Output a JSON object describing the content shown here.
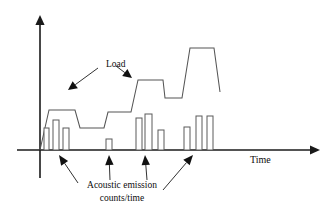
{
  "figure": {
    "background_color": "#ffffff",
    "axis_color": "#1a1a1a",
    "curve_color": "#555555",
    "bar_stroke_color": "#5a5a5a",
    "bar_fill_color": "#ffffff"
  },
  "labels": {
    "x_axis": "Time",
    "load": "Load",
    "caption_line1": "Acoustic emission",
    "caption_line2": "counts/time"
  },
  "icons": {
    "y_axis_arrow": "arrow-up-icon",
    "x_axis_arrow": "arrow-right-icon",
    "load_pointer_1": "arrow-pointer-icon",
    "load_pointer_2": "arrow-pointer-icon",
    "ae_pointer_1": "arrow-up-pointer-icon",
    "ae_pointer_2": "arrow-up-pointer-icon",
    "ae_pointer_3": "arrow-up-pointer-icon",
    "ae_pointer_4": "arrow-up-pointer-icon"
  },
  "chart_data": {
    "type": "bar",
    "title": "",
    "xlabel": "Time",
    "ylabel": "",
    "grid": false,
    "legend": "none",
    "axis": {
      "origin_x": 40,
      "baseline_y": 150,
      "y_axis_top": 15,
      "y_axis_bottom": 178,
      "x_axis_end": 320,
      "xlim": [
        0,
        320
      ],
      "ylim": [
        0,
        135
      ]
    },
    "series": [
      {
        "name": "Acoustic emission counts/time",
        "type": "bar",
        "note": "Burst clusters of acoustic emission counts, grouped into four events along the time axis",
        "bars": [
          {
            "cluster": 1,
            "x": 44.0,
            "width": 5.0,
            "height": 22.0,
            "top_y": 128.0
          },
          {
            "cluster": 1,
            "x": 53.0,
            "width": 6.0,
            "height": 30.0,
            "top_y": 120.0
          },
          {
            "cluster": 1,
            "x": 63.0,
            "width": 6.0,
            "height": 22.0,
            "top_y": 128.0
          },
          {
            "cluster": 2,
            "x": 106.0,
            "width": 6.0,
            "height": 11.0,
            "top_y": 139.0
          },
          {
            "cluster": 3,
            "x": 136.0,
            "width": 6.0,
            "height": 32.0,
            "top_y": 118.0
          },
          {
            "cluster": 3,
            "x": 145.0,
            "width": 7.0,
            "height": 36.0,
            "top_y": 114.0
          },
          {
            "cluster": 3,
            "x": 158.0,
            "width": 6.0,
            "height": 20.0,
            "top_y": 130.0
          },
          {
            "cluster": 4,
            "x": 184.0,
            "width": 6.0,
            "height": 23.0,
            "top_y": 127.0
          },
          {
            "cluster": 4,
            "x": 196.0,
            "width": 6.0,
            "height": 34.0,
            "top_y": 116.0
          },
          {
            "cluster": 4,
            "x": 207.0,
            "width": 6.0,
            "height": 34.0,
            "top_y": 116.0
          }
        ]
      },
      {
        "name": "Load",
        "type": "line",
        "note": "Stepped load history: each load increase is followed by a hold plateau; acoustic emission bursts occur at load increases",
        "points": [
          [
            40.0,
            150.0
          ],
          [
            49.0,
            110.0
          ],
          [
            75.0,
            110.0
          ],
          [
            80.0,
            128.0
          ],
          [
            104.0,
            128.0
          ],
          [
            108.0,
            112.0
          ],
          [
            131.0,
            112.0
          ],
          [
            138.0,
            80.0
          ],
          [
            163.0,
            80.0
          ],
          [
            165.0,
            98.0
          ],
          [
            182.0,
            98.0
          ],
          [
            190.0,
            48.0
          ],
          [
            214.0,
            48.0
          ],
          [
            220.0,
            92.0
          ]
        ]
      }
    ],
    "annotations": [
      {
        "name": "load-annotation",
        "text": "Load",
        "text_x": 106,
        "text_y": 64,
        "pointers": [
          {
            "from": [
              98,
              68
            ],
            "to": [
              68,
              90
            ]
          },
          {
            "from": [
              116,
              66
            ],
            "to": [
              132,
              78
            ]
          }
        ]
      },
      {
        "name": "acoustic-emission-annotation",
        "text": "Acoustic emission counts/time",
        "text_x": 120,
        "text_y": 186,
        "pointers": [
          {
            "from": [
              78,
              183
            ],
            "to": [
              59,
              155
            ]
          },
          {
            "from": [
              110,
              180
            ],
            "to": [
              109,
              155
            ]
          },
          {
            "from": [
              147,
              180
            ],
            "to": [
              145,
              155
            ]
          },
          {
            "from": [
              163,
              190
            ],
            "to": [
              193,
              155
            ]
          }
        ]
      }
    ]
  }
}
